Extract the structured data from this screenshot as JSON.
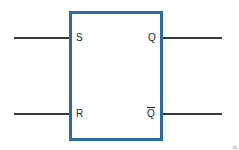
{
  "figure": {
    "background_color": "#ffffff",
    "box": {
      "border_color": "#2b6ca3",
      "fill_color": "#ffffff"
    },
    "wire_color": "#3a3a3a",
    "inputs": [
      {
        "name": "set-input",
        "label": "S"
      },
      {
        "name": "reset-input",
        "label": "R"
      }
    ],
    "outputs": [
      {
        "name": "q-output",
        "label": "Q",
        "overline": false
      },
      {
        "name": "q-not-output",
        "label": "Q",
        "overline": true
      }
    ],
    "credit": "© 2014 Cengage Learning"
  }
}
